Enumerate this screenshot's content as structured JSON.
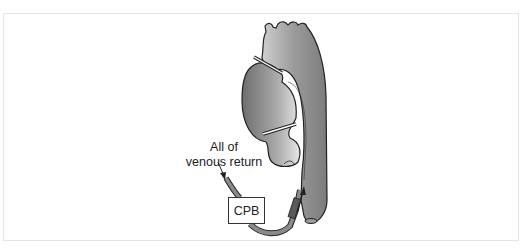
{
  "diagram": {
    "labels": {
      "venous_line1": "All of",
      "venous_line2": "venous return",
      "box": "CPB"
    },
    "elements": [
      {
        "name": "aortic-arch",
        "type": "vessel"
      },
      {
        "name": "heart",
        "type": "organ"
      },
      {
        "name": "clamp-upper",
        "type": "clamp"
      },
      {
        "name": "clamp-lower",
        "type": "clamp"
      },
      {
        "name": "venous-cannula",
        "type": "tube",
        "arrow": "into CPB"
      },
      {
        "name": "arterial-cannula",
        "type": "tube",
        "arrow": "into aorta"
      }
    ],
    "colors": {
      "vessel_dark": "#7a7a7a",
      "vessel_light": "#d8d8d8",
      "outline": "#222222"
    }
  }
}
